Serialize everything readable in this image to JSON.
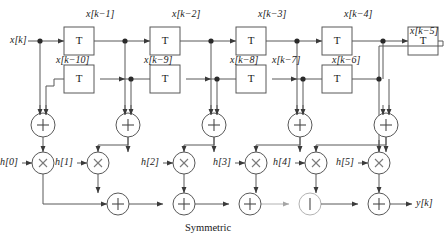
{
  "figure": {
    "caption": "Symmetric",
    "input_label": "x[k]",
    "output_label": "y[k]",
    "delay_block_label": "T",
    "adder_symbol": "+",
    "multiplier_symbol": "×",
    "line_color": "#585858",
    "text_color": "#1a1a1a"
  },
  "top_delays": [
    {
      "name": "delay-top-1",
      "out_label": "x[k−1]"
    },
    {
      "name": "delay-top-2",
      "out_label": "x[k−2]"
    },
    {
      "name": "delay-top-3",
      "out_label": "x[k−3]"
    },
    {
      "name": "delay-top-4",
      "out_label": "x[k−4]"
    },
    {
      "name": "delay-top-5",
      "out_label": "x[k−5]"
    }
  ],
  "bottom_delays": [
    {
      "name": "delay-bottom-10",
      "out_label": "x[k−10]"
    },
    {
      "name": "delay-bottom-9",
      "out_label": "x[k−9]"
    },
    {
      "name": "delay-bottom-8",
      "out_label": "x[k−8]"
    },
    {
      "name": "delay-bottom-7",
      "out_label": "x[k−7]"
    },
    {
      "name": "delay-bottom-6",
      "out_label": "x[k−6]"
    }
  ],
  "coefficients": [
    {
      "name": "coefficient-h0",
      "label": "h[0]"
    },
    {
      "name": "coefficient-h1",
      "label": "h[1]"
    },
    {
      "name": "coefficient-h2",
      "label": "h[2]"
    },
    {
      "name": "coefficient-h3",
      "label": "h[3]"
    },
    {
      "name": "coefficient-h4",
      "label": "h[4]"
    },
    {
      "name": "coefficient-h5",
      "label": "h[5]"
    }
  ],
  "tap_adders": [
    {
      "name": "tap-adder-0"
    },
    {
      "name": "tap-adder-1"
    },
    {
      "name": "tap-adder-2"
    },
    {
      "name": "tap-adder-3"
    },
    {
      "name": "tap-adder-4"
    }
  ],
  "accumulators": [
    {
      "name": "accumulator-1"
    },
    {
      "name": "accumulator-2"
    },
    {
      "name": "accumulator-3"
    },
    {
      "name": "accumulator-4"
    },
    {
      "name": "accumulator-5"
    }
  ]
}
